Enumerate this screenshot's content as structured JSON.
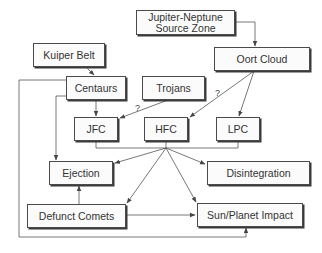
{
  "diagram": {
    "nodes": {
      "source_zone": {
        "label": "Jupiter-Neptune\nSource Zone"
      },
      "oort_cloud": {
        "label": "Oort Cloud"
      },
      "kuiper_belt": {
        "label": "Kuiper Belt"
      },
      "centaurs": {
        "label": "Centaurs"
      },
      "trojans": {
        "label": "Trojans"
      },
      "jfc": {
        "label": "JFC"
      },
      "hfc": {
        "label": "HFC"
      },
      "lpc": {
        "label": "LPC"
      },
      "ejection": {
        "label": "Ejection"
      },
      "disintegration": {
        "label": "Disintegration"
      },
      "defunct_comets": {
        "label": "Defunct Comets"
      },
      "impact": {
        "label": "Sun/Planet Impact"
      }
    },
    "edges": [
      {
        "from": "Jupiter-Neptune Source Zone",
        "to": "Oort Cloud"
      },
      {
        "from": "Kuiper Belt",
        "to": "Centaurs"
      },
      {
        "from": "Centaurs",
        "to": "JFC"
      },
      {
        "from": "Centaurs",
        "to": "Ejection"
      },
      {
        "from": "Centaurs",
        "to": "Sun/Planet Impact"
      },
      {
        "from": "Trojans",
        "to": "JFC",
        "label": "?"
      },
      {
        "from": "Oort Cloud",
        "to": "HFC",
        "label": "?"
      },
      {
        "from": "Oort Cloud",
        "to": "LPC"
      },
      {
        "from": "JFC/HFC/LPC",
        "to": "Ejection"
      },
      {
        "from": "JFC/HFC/LPC",
        "to": "Disintegration"
      },
      {
        "from": "JFC/HFC/LPC",
        "to": "Defunct Comets"
      },
      {
        "from": "JFC/HFC/LPC",
        "to": "Sun/Planet Impact"
      },
      {
        "from": "Defunct Comets",
        "to": "Ejection"
      },
      {
        "from": "Defunct Comets",
        "to": "Sun/Planet Impact"
      }
    ],
    "uncertain_marks": {
      "trojans_jfc": "?",
      "oort_hfc": "?"
    }
  }
}
